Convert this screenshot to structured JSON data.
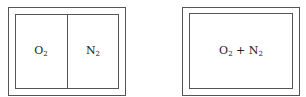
{
  "left_container": {
    "description": "Insulated container with partition",
    "compartments": [
      {
        "gas": "O",
        "subscript": "2"
      },
      {
        "gas": "N",
        "subscript": "2"
      }
    ]
  },
  "right_container": {
    "description": "Insulated container, mixed gases",
    "mixture": {
      "a": "O",
      "a_sub": "2",
      "op": "+",
      "b": "N",
      "b_sub": "2"
    }
  },
  "colors": {
    "line": "#555555",
    "text": "#222222",
    "background": "#ffffff"
  }
}
